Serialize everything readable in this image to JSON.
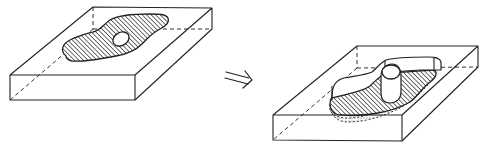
{
  "figure": {
    "left_panel": {
      "label": "initial-state",
      "elements": [
        "block",
        "hatched-profile",
        "hole"
      ]
    },
    "arrow": {
      "glyph": "implies-arrow",
      "direction": "right"
    },
    "right_panel": {
      "label": "result-state",
      "elements": [
        "block",
        "raised-wall",
        "hatched-floor",
        "dotted-shadow",
        "hole-boss"
      ]
    }
  },
  "colors": {
    "line": "#222222",
    "background": "#ffffff"
  }
}
